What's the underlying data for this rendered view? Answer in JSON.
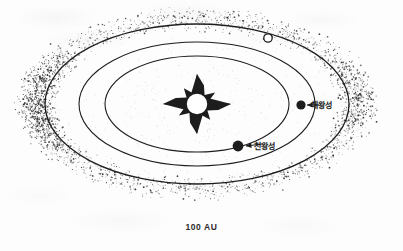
{
  "figure": {
    "kind": "astronomy-diagram",
    "caption": "100 AU",
    "background_color": "#fdfdfd",
    "ink_color": "#1d1d1d",
    "center": {
      "x": 197,
      "y": 104
    },
    "sun": {
      "name": "sun-star-glyph",
      "points": 4,
      "core_radius": 11,
      "core_fill": "#ffffff",
      "ray_length_x": 34,
      "ray_length_y": 30,
      "stroke": "#1d1d1d"
    },
    "orbits": [
      {
        "name": "inner-orbit",
        "rx": 92,
        "ry": 48,
        "stroke_width": 1.1
      },
      {
        "name": "middle-orbit",
        "rx": 118,
        "ry": 62,
        "stroke_width": 1.1
      },
      {
        "name": "outer-orbit",
        "rx": 152,
        "ry": 80,
        "stroke_width": 1.3
      }
    ],
    "dust_band": {
      "name": "kuiper-belt-stipple",
      "inner_rx": 140,
      "inner_ry": 72,
      "outer_rx": 182,
      "outer_ry": 98,
      "dot_count": 2100,
      "dot_color": "#2a2a2a"
    },
    "bodies": [
      {
        "name": "pluto-marker",
        "label": "",
        "style": "hollow",
        "radius": 4.2,
        "x": 268,
        "y": 38,
        "has_leader": false
      },
      {
        "name": "neptune-marker",
        "label": "해왕성",
        "style": "filled",
        "radius": 4.6,
        "x": 301,
        "y": 105,
        "has_leader": true,
        "leader": {
          "x1": 319,
          "y1": 105,
          "x2": 307,
          "y2": 105
        }
      },
      {
        "name": "uranus-marker",
        "label": "천왕성",
        "style": "filled",
        "radius": 5.4,
        "x": 238,
        "y": 146,
        "has_leader": true,
        "leader": {
          "x1": 262,
          "y1": 144,
          "x2": 246,
          "y2": 146
        }
      }
    ]
  }
}
